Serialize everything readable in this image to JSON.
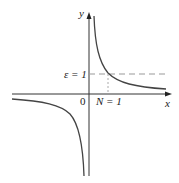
{
  "diagram": {
    "function": "y = 1/x",
    "labels": {
      "y_axis": "y",
      "x_axis": "x",
      "origin": "0",
      "epsilon": "ε = 1",
      "n_value": "N = 1"
    },
    "colors": {
      "axis": "#333333",
      "curve": "#444444",
      "dashed": "#999999"
    }
  }
}
